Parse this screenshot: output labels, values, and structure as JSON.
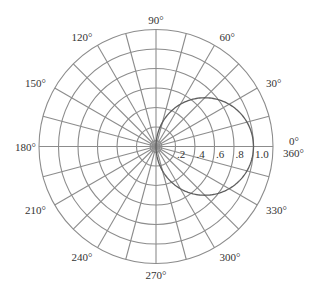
{
  "chart_data": {
    "type": "polar",
    "title": "",
    "curve": {
      "name": "r = cos(theta)",
      "description": "circle of diameter 1.0 passing through the origin, centered on the 0° axis at r = 0.5",
      "theta_deg": [
        -90,
        -75,
        -60,
        -45,
        -30,
        -15,
        0,
        15,
        30,
        45,
        60,
        75,
        90
      ],
      "r": [
        0.0,
        0.259,
        0.5,
        0.707,
        0.866,
        0.966,
        1.0,
        0.966,
        0.866,
        0.707,
        0.5,
        0.259,
        0.0
      ]
    },
    "radial_axis": {
      "range": [
        0,
        1.2
      ],
      "rings": [
        0.2,
        0.4,
        0.6,
        0.8,
        1.0,
        1.2
      ],
      "tick_labels": [
        ".2",
        ".4",
        ".6",
        ".8",
        "1.0"
      ],
      "tick_values": [
        0.2,
        0.4,
        0.6,
        0.8,
        1.0
      ],
      "label_angle_deg": 0
    },
    "angular_axis": {
      "spoke_interval_deg": 15,
      "spoke_count": 24,
      "labels": [
        {
          "angle": 0,
          "text": "0°"
        },
        {
          "angle": 0,
          "text": "360°"
        },
        {
          "angle": 30,
          "text": "30°"
        },
        {
          "angle": 60,
          "text": "60°"
        },
        {
          "angle": 90,
          "text": "90°"
        },
        {
          "angle": 120,
          "text": "120°"
        },
        {
          "angle": 150,
          "text": "150°"
        },
        {
          "angle": 180,
          "text": "180°"
        },
        {
          "angle": 210,
          "text": "210°"
        },
        {
          "angle": 240,
          "text": "240°"
        },
        {
          "angle": 270,
          "text": "270°"
        },
        {
          "angle": 300,
          "text": "300°"
        },
        {
          "angle": 330,
          "text": "330°"
        }
      ]
    },
    "grid": true,
    "legend": null
  },
  "colors": {
    "grid": "#8c8c8c",
    "curve": "#5e5e5e",
    "text": "#333333",
    "background": "#ffffff"
  }
}
